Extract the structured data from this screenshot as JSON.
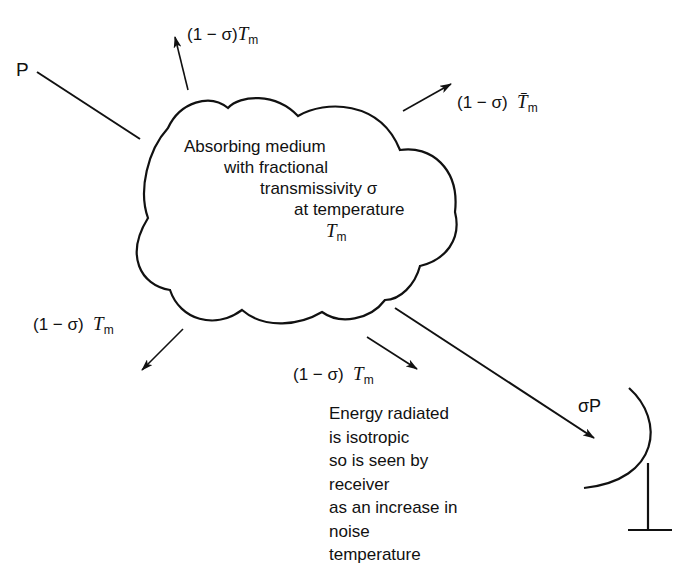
{
  "figure": {
    "incident_signal_label": "P",
    "transmitted_signal_label": "σP",
    "medium": {
      "lines": [
        "Absorbing medium",
        "with fractional",
        "transmissivity σ",
        "at temperature"
      ],
      "temperature_symbol": "T",
      "temperature_subscript": "m"
    },
    "radiation_labels": {
      "top": {
        "prefix": "(1 − σ)",
        "symbol": "T",
        "subscript": "m"
      },
      "right": {
        "prefix": "(1 − σ)",
        "symbol": "T̄",
        "subscript": "m"
      },
      "left": {
        "prefix": "(1 − σ)",
        "symbol": "T",
        "subscript": "m"
      },
      "bottom": {
        "prefix": "(1 − σ)",
        "symbol": "T",
        "subscript": "m"
      }
    },
    "note": {
      "lines": [
        "Energy radiated",
        "is isotropic",
        "so is seen by",
        "receiver",
        "as an increase in",
        "noise",
        "temperature"
      ]
    },
    "colors": {
      "stroke": "#111111",
      "background": "#ffffff"
    }
  }
}
